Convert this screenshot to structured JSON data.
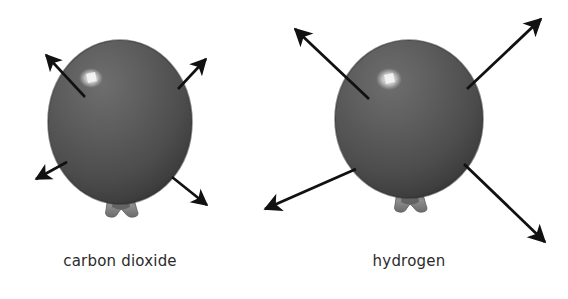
{
  "figure": {
    "background_color": "#ffffff",
    "width": 568,
    "height": 299
  },
  "panels": [
    {
      "id": "carbon-dioxide",
      "caption": "carbon dioxide",
      "balloon": {
        "name": "balloon-shape",
        "center_x": 120,
        "center_y": 122,
        "radius_x": 72,
        "radius_y": 82,
        "fill_color": "#5a5a5a",
        "shade_color": "#3c3c3c",
        "highlight_color": "#f0f0f0",
        "knot_color": "#8a8a8a"
      },
      "arrows": [
        {
          "name": "arrow-up-left",
          "x1": 85,
          "y1": 97,
          "x2": 42,
          "y2": 51
        },
        {
          "name": "arrow-up-right",
          "x1": 178,
          "y1": 89,
          "x2": 209,
          "y2": 55
        },
        {
          "name": "arrow-down-left",
          "x1": 67,
          "y1": 162,
          "x2": 31,
          "y2": 181
        },
        {
          "name": "arrow-down-right",
          "x1": 172,
          "y1": 177,
          "x2": 211,
          "y2": 209
        }
      ],
      "arrow_count": 4,
      "arrow_color": "#111111"
    },
    {
      "id": "hydrogen",
      "caption": "hydrogen",
      "balloon": {
        "name": "balloon-shape",
        "center_x": 409,
        "center_y": 119,
        "radius_x": 74,
        "radius_y": 79,
        "fill_color": "#5a5a5a",
        "shade_color": "#3c3c3c",
        "highlight_color": "#f0f0f0",
        "knot_color": "#8a8a8a"
      },
      "arrows": [
        {
          "name": "arrow-up-left",
          "x1": 369,
          "y1": 99,
          "x2": 291,
          "y2": 25
        },
        {
          "name": "arrow-up-right",
          "x1": 467,
          "y1": 89,
          "x2": 545,
          "y2": 15
        },
        {
          "name": "arrow-down-left",
          "x1": 356,
          "y1": 169,
          "x2": 260,
          "y2": 211
        },
        {
          "name": "arrow-down-right",
          "x1": 464,
          "y1": 164,
          "x2": 549,
          "y2": 246
        }
      ],
      "arrow_count": 4,
      "arrow_color": "#111111"
    }
  ]
}
